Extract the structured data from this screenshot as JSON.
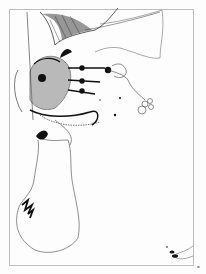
{
  "artwork": {
    "subject": "pen-and-ink surreal illustration",
    "colors": {
      "background": "#fdfdfd",
      "ink": "#111111",
      "frame": "#bdbdbd",
      "outline": "#555555"
    },
    "elements": [
      "ornate-fan-plume",
      "patterned-heart-face",
      "flower-stems",
      "knotted-loop-ornament",
      "winding-contour-shape",
      "zigzag-ink-stroke",
      "ink-splatter"
    ]
  },
  "corner_mark": "▪"
}
